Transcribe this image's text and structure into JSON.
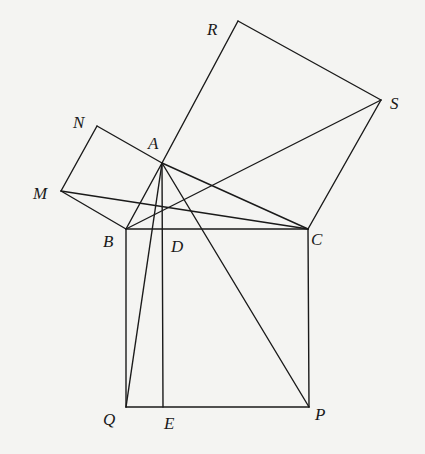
{
  "diagram": {
    "points": {
      "A": [
        162,
        163
      ],
      "B": [
        126,
        229
      ],
      "C": [
        308,
        229
      ],
      "D": [
        162,
        229
      ],
      "E": [
        163,
        407
      ],
      "P": [
        309,
        407
      ],
      "Q": [
        126,
        407
      ],
      "M": [
        61,
        191
      ],
      "N": [
        97,
        126
      ],
      "R": [
        238,
        21
      ],
      "S": [
        381,
        100
      ]
    },
    "labels": [
      {
        "text": "R",
        "x": 207,
        "y": 35
      },
      {
        "text": "S",
        "x": 390,
        "y": 109
      },
      {
        "text": "N",
        "x": 73,
        "y": 128
      },
      {
        "text": "A",
        "x": 148,
        "y": 149
      },
      {
        "text": "M",
        "x": 33,
        "y": 199
      },
      {
        "text": "B",
        "x": 103,
        "y": 247
      },
      {
        "text": "D",
        "x": 171,
        "y": 252
      },
      {
        "text": "C",
        "x": 311,
        "y": 245
      },
      {
        "text": "Q",
        "x": 103,
        "y": 425
      },
      {
        "text": "E",
        "x": 164,
        "y": 429
      },
      {
        "text": "P",
        "x": 315,
        "y": 420
      }
    ],
    "segments": [
      [
        "A",
        "B"
      ],
      [
        "A",
        "C"
      ],
      [
        "B",
        "C"
      ],
      [
        "B",
        "Q"
      ],
      [
        "Q",
        "P"
      ],
      [
        "P",
        "C"
      ],
      [
        "A",
        "N"
      ],
      [
        "N",
        "M"
      ],
      [
        "M",
        "B"
      ],
      [
        "A",
        "R"
      ],
      [
        "R",
        "S"
      ],
      [
        "S",
        "C"
      ],
      [
        "A",
        "Q"
      ],
      [
        "A",
        "P"
      ],
      [
        "A",
        "E"
      ],
      [
        "M",
        "C"
      ],
      [
        "B",
        "S"
      ]
    ]
  }
}
